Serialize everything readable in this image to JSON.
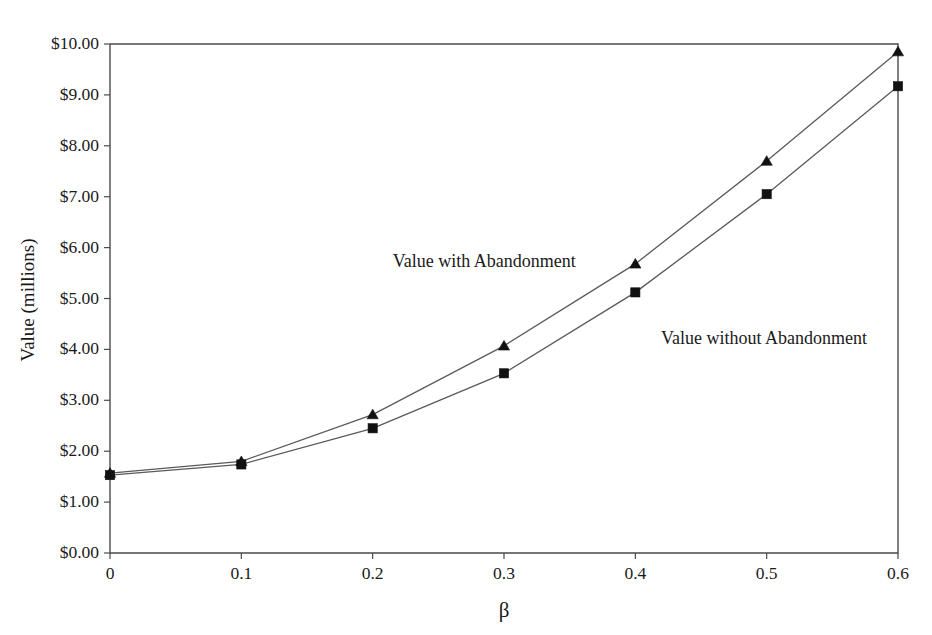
{
  "chart_data": {
    "type": "line",
    "title": "",
    "subtitle": "",
    "xlabel": "β",
    "ylabel": "Value (millions)",
    "x": [
      0,
      0.1,
      0.2,
      0.3,
      0.4,
      0.5,
      0.6
    ],
    "xtick_labels": [
      "0",
      "0.1",
      "0.2",
      "0.3",
      "0.4",
      "0.5",
      "0.6"
    ],
    "ytick_labels": [
      "$0.00",
      "$1.00",
      "$2.00",
      "$3.00",
      "$4.00",
      "$5.00",
      "$6.00",
      "$7.00",
      "$8.00",
      "$9.00",
      "$10.00"
    ],
    "ytick_values": [
      0,
      1,
      2,
      3,
      4,
      5,
      6,
      7,
      8,
      9,
      10
    ],
    "xlim": [
      0,
      0.6
    ],
    "ylim": [
      0,
      10
    ],
    "grid": false,
    "legend_position": "inline-annotations",
    "series": [
      {
        "name": "Value with Abandonment",
        "marker": "triangle",
        "color": "#111111",
        "values": [
          1.57,
          1.8,
          2.72,
          4.07,
          5.68,
          7.7,
          9.85
        ]
      },
      {
        "name": "Value without Abandonment",
        "marker": "square",
        "color": "#111111",
        "values": [
          1.53,
          1.74,
          2.45,
          3.53,
          5.12,
          7.05,
          9.17
        ]
      }
    ],
    "annotations": [
      {
        "text": "Value with Abandonment",
        "x": 0.285,
        "y": 5.62
      },
      {
        "text": "Value without Abandonment",
        "x": 0.498,
        "y": 4.1
      }
    ]
  }
}
